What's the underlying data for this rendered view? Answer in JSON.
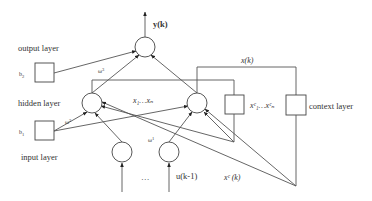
{
  "diagram": {
    "layers": {
      "output": "output layer",
      "hidden": "hidden layer",
      "input": "input layer",
      "context": "context layer"
    },
    "bias": {
      "b2": "b",
      "b2_sub": "2",
      "b1": "b",
      "b1_sub": "1"
    },
    "weights": {
      "w3": "ω",
      "w3_sup": "3",
      "w2": "ω",
      "w2_sup": "2",
      "w1": "ω",
      "w1_sup": "1"
    },
    "signals": {
      "output": "y(k)",
      "state": "x(k)",
      "hidden_nodes": "x₁…xₙ",
      "context_nodes": "xᶜ₁…xᶜₙ",
      "context_signal": "xᶜ (k)",
      "input": "u(k-1)",
      "ellipsis": "…"
    },
    "colors": {
      "line": "#555555",
      "text": "#333333",
      "background": "#ffffff"
    }
  }
}
